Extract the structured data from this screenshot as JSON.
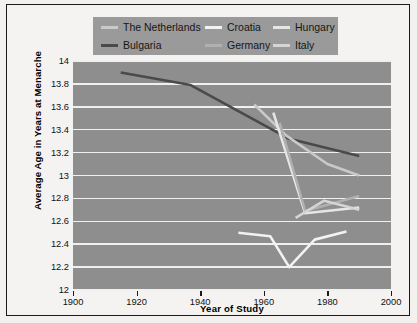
{
  "chart_data": {
    "type": "line",
    "title": "",
    "xlabel": "Year of Study",
    "ylabel": "Average Age in Years at Menarche",
    "xlim": [
      1900,
      2000
    ],
    "ylim": [
      12,
      14
    ],
    "xticks": [
      1900,
      1920,
      1940,
      1960,
      1980,
      2000
    ],
    "yticks": [
      12,
      12.2,
      12.4,
      12.6,
      12.8,
      13,
      13.2,
      13.4,
      13.6,
      13.8,
      14
    ],
    "xtick_labels": [
      "1900",
      "1920",
      "1940",
      "1960",
      "1980",
      "2000"
    ],
    "ytick_labels": [
      "12",
      "12.2",
      "12.4",
      "12.6",
      "12.8",
      "13",
      "13.2",
      "13.4",
      "13.6",
      "13.8",
      "14"
    ],
    "grid": "horizontal",
    "legend_position": "top",
    "plot_background": "#8e8e8e",
    "gridline_color": "#f0f0ee",
    "series": [
      {
        "name": "Bulgaria",
        "color": "#4a4a4a",
        "width": 2.6,
        "x": [
          1915,
          1937,
          1968,
          1990
        ],
        "y": [
          13.9,
          13.79,
          13.32,
          13.17
        ]
      },
      {
        "name": "The Netherlands",
        "color": "#c9c9c9",
        "width": 2.6,
        "x": [
          1957,
          1967,
          1980,
          1990
        ],
        "y": [
          13.62,
          13.35,
          13.1,
          13.0
        ]
      },
      {
        "name": "Hungary",
        "color": "#e6e6e6",
        "width": 2.6,
        "x": [
          1963,
          1973,
          1990
        ],
        "y": [
          13.55,
          12.67,
          12.72
        ]
      },
      {
        "name": "Germany",
        "color": "#b0b0b0",
        "width": 2.6,
        "x": [
          1965,
          1973,
          1990
        ],
        "y": [
          13.46,
          12.69,
          12.82
        ]
      },
      {
        "name": "Italy",
        "color": "#d5d5d5",
        "width": 2.6,
        "x": [
          1970,
          1979,
          1990
        ],
        "y": [
          12.63,
          12.78,
          12.7
        ]
      },
      {
        "name": "Croatia",
        "color": "#f2f2f2",
        "width": 2.6,
        "x": [
          1952,
          1962,
          1968,
          1976,
          1986
        ],
        "y": [
          12.5,
          12.47,
          12.2,
          12.44,
          12.51
        ]
      }
    ]
  },
  "legend": {
    "rows": [
      [
        {
          "label": "The Netherlands",
          "color": "#c9c9c9"
        },
        {
          "label": "Croatia",
          "color": "#f2f2f2"
        },
        {
          "label": "Hungary",
          "color": "#e6e6e6"
        }
      ],
      [
        {
          "label": "Bulgaria",
          "color": "#4a4a4a"
        },
        {
          "label": "Germany",
          "color": "#b0b0b0"
        },
        {
          "label": "Italy",
          "color": "#d5d5d5"
        }
      ]
    ]
  }
}
